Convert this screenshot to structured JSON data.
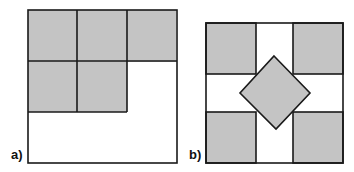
{
  "figure": {
    "colors": {
      "fill": "#c4c4c4",
      "stroke": "#1a1a1a",
      "background": "#ffffff"
    },
    "panels": [
      {
        "id": "a",
        "label": "a)",
        "description": "square with five shaded unit squares in an L arrangement (3 on top row, 2 on second row)"
      },
      {
        "id": "b",
        "label": "b)",
        "description": "square with four shaded corner squares and a shaded rotated square (diamond) in the center"
      }
    ]
  }
}
